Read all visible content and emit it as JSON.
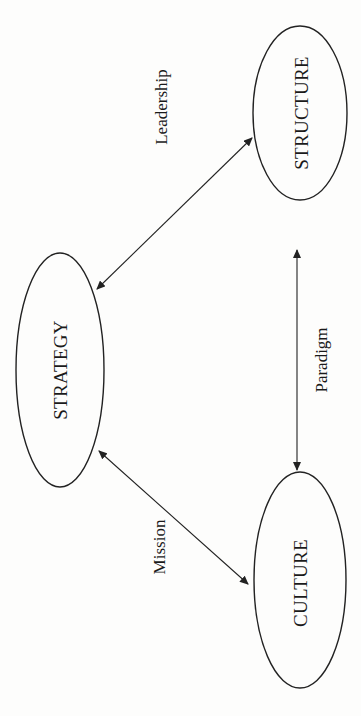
{
  "diagram": {
    "type": "concept-triangle",
    "orientation": "rotated-90-ccw",
    "nodes": [
      {
        "id": "strategy",
        "label": "STRATEGY",
        "cx": 60,
        "cy": 370,
        "rx": 44,
        "ry": 117
      },
      {
        "id": "structure",
        "label": "STRUCTURE",
        "cx": 300,
        "cy": 113,
        "rx": 47,
        "ry": 87
      },
      {
        "id": "culture",
        "label": "CULTURE",
        "cx": 300,
        "cy": 580,
        "rx": 46,
        "ry": 108
      }
    ],
    "edges": [
      {
        "id": "leadership",
        "from": "strategy",
        "to": "structure",
        "label": "Leadership",
        "bidirectional": true
      },
      {
        "id": "mission",
        "from": "strategy",
        "to": "culture",
        "label": "Mission",
        "bidirectional": true
      },
      {
        "id": "paradigm",
        "from": "structure",
        "to": "culture",
        "label": "Paradigm",
        "bidirectional": true
      }
    ]
  },
  "colors": {
    "stroke": "#222222",
    "text": "#1a1a1a",
    "background": "#fdfdfc"
  }
}
